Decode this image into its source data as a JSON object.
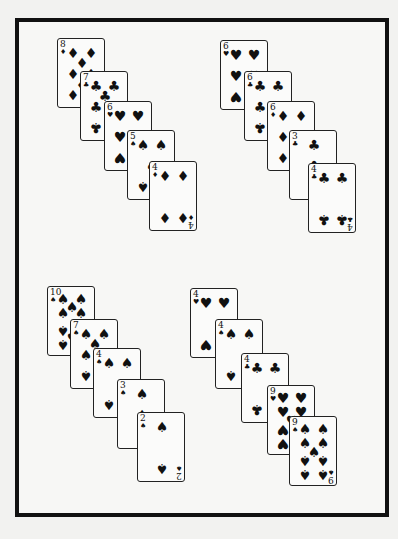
{
  "suit_glyphs": {
    "spades": "♠",
    "hearts": "♥",
    "diamonds": "♦",
    "clubs": "♣"
  },
  "groups": [
    {
      "name": "top-left",
      "cards": [
        {
          "rank": "8",
          "suit": "diamonds",
          "x": 57,
          "y": 38
        },
        {
          "rank": "7",
          "suit": "clubs",
          "x": 80,
          "y": 71
        },
        {
          "rank": "6",
          "suit": "hearts",
          "x": 104,
          "y": 101
        },
        {
          "rank": "5",
          "suit": "spades",
          "x": 127,
          "y": 130
        },
        {
          "rank": "4",
          "suit": "diamonds",
          "x": 149,
          "y": 161
        }
      ]
    },
    {
      "name": "top-right",
      "cards": [
        {
          "rank": "6",
          "suit": "hearts",
          "x": 220,
          "y": 40
        },
        {
          "rank": "6",
          "suit": "clubs",
          "x": 244,
          "y": 71
        },
        {
          "rank": "6",
          "suit": "diamonds",
          "x": 267,
          "y": 101
        },
        {
          "rank": "3",
          "suit": "clubs",
          "x": 289,
          "y": 130
        },
        {
          "rank": "4",
          "suit": "clubs",
          "x": 308,
          "y": 163
        }
      ]
    },
    {
      "name": "bottom-left",
      "cards": [
        {
          "rank": "10",
          "suit": "spades",
          "x": 47,
          "y": 286
        },
        {
          "rank": "7",
          "suit": "spades",
          "x": 70,
          "y": 319
        },
        {
          "rank": "4",
          "suit": "spades",
          "x": 93,
          "y": 348
        },
        {
          "rank": "3",
          "suit": "spades",
          "x": 117,
          "y": 379
        },
        {
          "rank": "2",
          "suit": "spades",
          "x": 137,
          "y": 412
        }
      ]
    },
    {
      "name": "bottom-right",
      "cards": [
        {
          "rank": "4",
          "suit": "hearts",
          "x": 190,
          "y": 288
        },
        {
          "rank": "4",
          "suit": "spades",
          "x": 215,
          "y": 319
        },
        {
          "rank": "4",
          "suit": "clubs",
          "x": 241,
          "y": 353
        },
        {
          "rank": "9",
          "suit": "hearts",
          "x": 267,
          "y": 385
        },
        {
          "rank": "9",
          "suit": "spades",
          "x": 289,
          "y": 416
        }
      ]
    }
  ]
}
